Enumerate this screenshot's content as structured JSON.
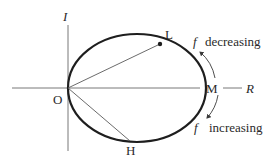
{
  "diagram": {
    "type": "ellipse-phasor-locus",
    "axes": {
      "vertical_label": "I",
      "horizontal_label": "R",
      "origin_label": "O"
    },
    "points": {
      "L": "L",
      "M": "M",
      "H": "H"
    },
    "annotations": {
      "upper_symbol": "f",
      "upper_text": "decreasing",
      "lower_symbol": "f",
      "lower_text": "increasing"
    },
    "colors": {
      "curve": "#1e1e1e",
      "axes": "#6a6a6a",
      "text": "#2a2a2a"
    }
  }
}
